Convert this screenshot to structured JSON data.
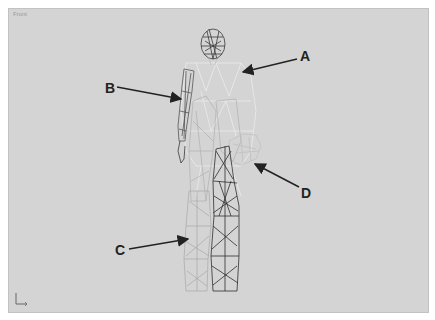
{
  "viewport": {
    "label": "Front",
    "background": "#d4d4d4"
  },
  "model": {
    "name": "wireframe-human-figure",
    "colors": {
      "head": "#3a3a3a",
      "torso_highlight": "#eeeeee",
      "arm_left": "#5a5a5a",
      "leg_light": "#a8a8a8",
      "leg_dark": "#2e2e2e",
      "hand_ghost": "#bdbdbd"
    }
  },
  "callouts": [
    {
      "id": "A",
      "label": "A",
      "target": "torso"
    },
    {
      "id": "B",
      "label": "B",
      "target": "left-arm"
    },
    {
      "id": "C",
      "label": "C",
      "target": "right-leg"
    },
    {
      "id": "D",
      "label": "D",
      "target": "left-hand"
    }
  ],
  "axis_gizmo": {
    "x_label": "x",
    "y_label": "y"
  }
}
